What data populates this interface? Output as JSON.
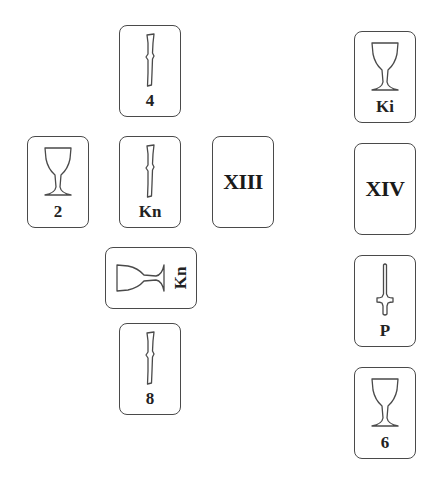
{
  "layout": {
    "name": "tarot-spread",
    "stroke_color": "#4a4a4a",
    "background": "#ffffff"
  },
  "cross": {
    "top": {
      "suit": "wands",
      "label": "4",
      "x": 119,
      "y": 25
    },
    "left": {
      "suit": "cups",
      "label": "2",
      "x": 27,
      "y": 136
    },
    "center": {
      "suit": "wands",
      "label": "Kn",
      "x": 119,
      "y": 136
    },
    "right": {
      "suit": "major",
      "label": "XIII",
      "x": 212,
      "y": 136
    },
    "crossing": {
      "suit": "cups",
      "label": "Kn",
      "x": 120,
      "y": 232,
      "rotation": -90
    },
    "bottom": {
      "suit": "wands",
      "label": "8",
      "x": 119,
      "y": 323
    }
  },
  "staff": [
    {
      "suit": "cups",
      "label": "Ki",
      "x": 354,
      "y": 31
    },
    {
      "suit": "major",
      "label": "XIV",
      "x": 354,
      "y": 143
    },
    {
      "suit": "swords",
      "label": "P",
      "x": 354,
      "y": 255
    },
    {
      "suit": "cups",
      "label": "6",
      "x": 354,
      "y": 367
    }
  ]
}
